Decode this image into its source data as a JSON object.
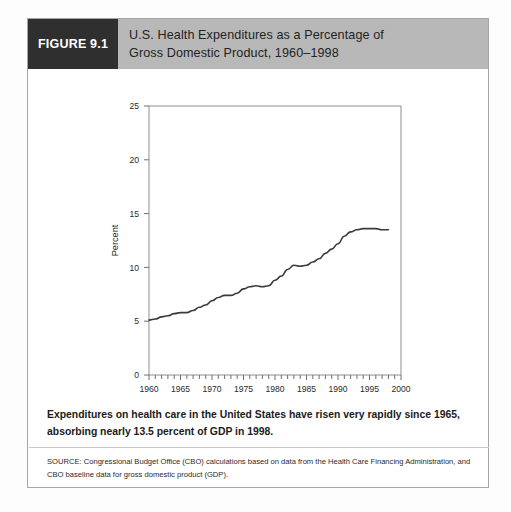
{
  "figure": {
    "number_label": "FIGURE 9.1",
    "title_line_1": "U.S. Health Expenditures as a Percentage of",
    "title_line_2": "Gross Domestic Product, 1960–1998",
    "caption": "Expenditures on health care in the United States have risen very rapidly since 1965, absorbing nearly 13.5 percent of GDP in 1998.",
    "source": "SOURCE: Congressional Budget Office (CBO) calculations based on data from the Health Care Financing Administration, and CBO baseline data for gross domestic product (GDP).",
    "colors": {
      "number_bar": "#2f2f2f",
      "title_bar": "#b8b8b8",
      "frame_border": "#a6a6a6",
      "line": "#3a3a3a"
    }
  },
  "chart_data": {
    "type": "line",
    "title": "U.S. Health Expenditures as a Percentage of Gross Domestic Product, 1960–1998",
    "xlabel": "Year",
    "ylabel": "Percent",
    "xlim": [
      1960,
      2000
    ],
    "ylim": [
      0,
      25
    ],
    "ytick_values": [
      0,
      5,
      10,
      15,
      20,
      25
    ],
    "ytick_labels": [
      "0",
      "5",
      "10",
      "15",
      "20",
      "25"
    ],
    "xtick_values": [
      1960,
      1965,
      1970,
      1975,
      1980,
      1985,
      1990,
      1995,
      2000
    ],
    "xtick_labels": [
      "1960",
      "1965",
      "1970",
      "1975",
      "1980",
      "1985",
      "1990",
      "1995",
      "2000"
    ],
    "xtick_minor_step": 1,
    "grid": false,
    "legend": false,
    "series": [
      {
        "name": "Health expenditures as % of GDP",
        "x": [
          1960,
          1961,
          1962,
          1963,
          1964,
          1965,
          1966,
          1967,
          1968,
          1969,
          1970,
          1971,
          1972,
          1973,
          1974,
          1975,
          1976,
          1977,
          1978,
          1979,
          1980,
          1981,
          1982,
          1983,
          1984,
          1985,
          1986,
          1987,
          1988,
          1989,
          1990,
          1991,
          1992,
          1993,
          1994,
          1995,
          1996,
          1997,
          1998
        ],
        "values": [
          5.1,
          5.2,
          5.4,
          5.5,
          5.7,
          5.8,
          5.8,
          6.0,
          6.3,
          6.5,
          6.9,
          7.2,
          7.4,
          7.4,
          7.6,
          8.0,
          8.2,
          8.3,
          8.2,
          8.3,
          8.8,
          9.2,
          9.8,
          10.2,
          10.1,
          10.2,
          10.5,
          10.8,
          11.3,
          11.7,
          12.2,
          12.9,
          13.3,
          13.5,
          13.6,
          13.6,
          13.6,
          13.5,
          13.5
        ]
      }
    ],
    "annotations": []
  }
}
